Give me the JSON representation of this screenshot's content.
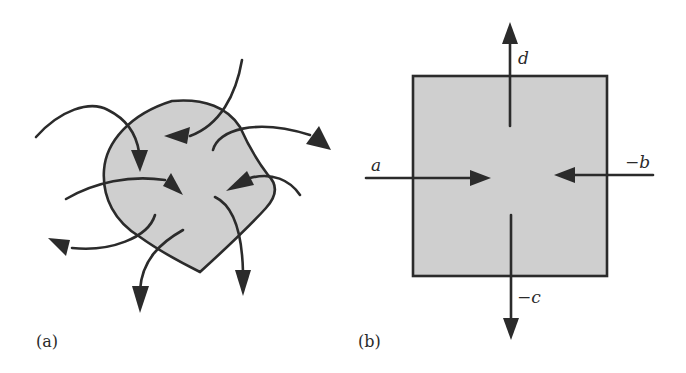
{
  "figure": {
    "panels": [
      {
        "id": "a",
        "label": "(a)",
        "shape": "irregular-blob",
        "fill_color": "#cfcfcf",
        "outline_color": "#2b2b2b",
        "arrow_count": 8,
        "description": "Curved arrows entering and leaving an irregular region"
      },
      {
        "id": "b",
        "label": "(b)",
        "shape": "square",
        "fill_color": "#cfcfcf",
        "outline_color": "#2b2b2b",
        "arrows": [
          {
            "label": "a",
            "direction": "in-from-left"
          },
          {
            "label": "−b",
            "direction": "in-from-right"
          },
          {
            "label": "−c",
            "direction": "out-bottom"
          },
          {
            "label": "d",
            "direction": "out-top"
          }
        ]
      }
    ]
  }
}
